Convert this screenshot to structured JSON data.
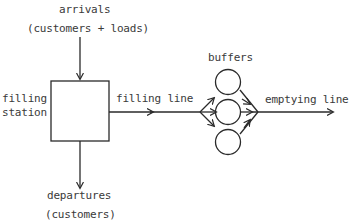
{
  "diagram": {
    "labels": {
      "arrivals": "arrivals",
      "arrivals_detail": "(customers + loads)",
      "filling_station_1": "filling",
      "filling_station_2": "station",
      "filling_line": "filling line",
      "buffers": "buffers",
      "emptying_line": "emptying line",
      "departures": "departures",
      "departures_detail": "(customers)"
    },
    "nodes": [
      {
        "id": "filling-station",
        "shape": "rectangle"
      },
      {
        "id": "buffer-1",
        "shape": "circle"
      },
      {
        "id": "buffer-2",
        "shape": "circle"
      },
      {
        "id": "buffer-3",
        "shape": "circle"
      }
    ],
    "edges": [
      {
        "from": "arrivals",
        "to": "filling-station"
      },
      {
        "from": "filling-station",
        "to": "departures"
      },
      {
        "from": "filling-station",
        "to": "buffers",
        "label": "filling line"
      },
      {
        "from": "buffers",
        "to": "out",
        "label": "emptying line"
      }
    ],
    "stroke_color": "#2a2a2a"
  }
}
